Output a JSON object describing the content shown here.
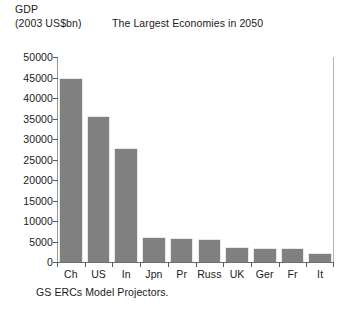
{
  "chart_data": {
    "type": "bar",
    "title": "The Largest Economies in 2050",
    "ylabel_line1": "GDP",
    "ylabel_line2": "(2003 US$bn)",
    "xlabel": "",
    "caption": "GS ERCs Model Projectors.",
    "categories": [
      "Ch",
      "US",
      "In",
      "Jpn",
      "Pr",
      "Russ",
      "UK",
      "Ger",
      "Fr",
      "It"
    ],
    "values": [
      45000,
      35500,
      27800,
      6200,
      5800,
      5600,
      3600,
      3500,
      3400,
      2100
    ],
    "ylim": [
      0,
      50000
    ],
    "yticks": [
      0,
      5000,
      10000,
      15000,
      20000,
      25000,
      30000,
      35000,
      40000,
      45000,
      50000
    ],
    "ytick_labels": [
      "0",
      "5000",
      "10000",
      "15000",
      "20000",
      "25000",
      "30000",
      "35000",
      "40000",
      "45000",
      "50000"
    ],
    "grid": false,
    "legend": null,
    "bar_color": "#808080",
    "background_color": "#ffffff",
    "axis_color": "#5a5a5a"
  }
}
